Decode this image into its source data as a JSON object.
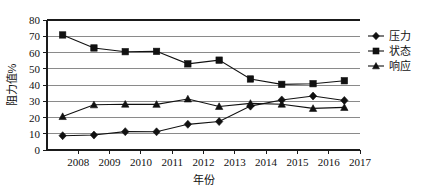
{
  "chart_data": {
    "type": "line",
    "title": "",
    "xlabel": "年份",
    "ylabel": "阻力值%",
    "x": [
      2007.5,
      2008.5,
      2009.5,
      2010.5,
      2011.5,
      2012.5,
      2013.5,
      2014.5,
      2015.5,
      2016.5
    ],
    "xtick_labels": [
      "2008",
      "2009",
      "2010",
      "2011",
      "2012",
      "2013",
      "2014",
      "2015",
      "2016",
      "2017"
    ],
    "xtick_values": [
      2008,
      2009,
      2010,
      2011,
      2012,
      2013,
      2014,
      2015,
      2016,
      2017
    ],
    "xlim": [
      2007,
      2017
    ],
    "ytick_labels": [
      "0",
      "10",
      "20",
      "30",
      "40",
      "50",
      "60",
      "70",
      "80"
    ],
    "ytick_values": [
      0,
      10,
      20,
      30,
      40,
      50,
      60,
      70,
      80
    ],
    "ylim": [
      0,
      80
    ],
    "grid": true,
    "legend_position": "right",
    "series": [
      {
        "name": "压力",
        "marker": "diamond",
        "color": "#111111",
        "values": [
          8.8,
          9.2,
          11.3,
          11.2,
          15.8,
          17.5,
          27.0,
          30.8,
          33.2,
          30.5
        ]
      },
      {
        "name": "状态",
        "marker": "square",
        "color": "#111111",
        "values": [
          70.8,
          62.8,
          60.5,
          60.7,
          53.0,
          55.3,
          43.7,
          40.4,
          40.8,
          42.6
        ]
      },
      {
        "name": "响应",
        "marker": "triangle",
        "color": "#111111",
        "values": [
          20.6,
          27.8,
          28.2,
          28.1,
          31.4,
          26.8,
          28.7,
          28.2,
          25.6,
          26.2
        ]
      }
    ]
  }
}
